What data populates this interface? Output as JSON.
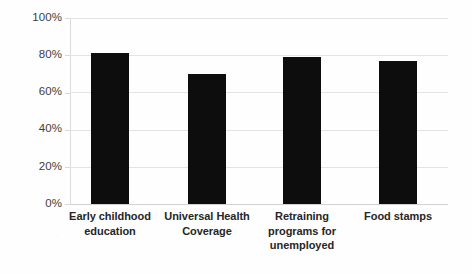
{
  "chart_data": {
    "type": "bar",
    "title": "",
    "subtitle": "",
    "xlabel": "",
    "ylabel": "",
    "categories": [
      "Early childhood education",
      "Universal Health Coverage",
      "Retraining programs for unemployed",
      "Food stamps"
    ],
    "category_lines": [
      [
        "Early childhood",
        "education"
      ],
      [
        "Universal Health",
        "Coverage"
      ],
      [
        "Retraining",
        "programs for",
        "unemployed"
      ],
      [
        "Food stamps"
      ]
    ],
    "values": [
      81,
      70,
      79,
      77
    ],
    "ylim": [
      0,
      100
    ],
    "ytick_values": [
      0,
      20,
      40,
      60,
      80,
      100
    ],
    "ytick_labels": [
      "0%",
      "20%",
      "40%",
      "60%",
      "80%",
      "100%"
    ],
    "grid": true,
    "grid_axis": "y",
    "legend": false,
    "legend_position": "none",
    "annotations": [],
    "bar_color": "#0d0d0d",
    "gridline_color": "#e3e3e3",
    "axis_color": "#dcdcdc",
    "background_color": "#fefefe",
    "label_color": "#262626",
    "tick_label_color": "#3d3d3d"
  }
}
